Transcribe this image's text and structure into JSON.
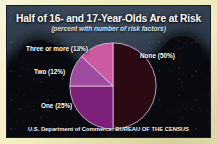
{
  "graphic": {
    "title": "Half of 16- and 17-Year-Olds Are at Risk",
    "subtitle": "(percent with number of risk factors)",
    "footer": "U.S. Department of Commerce: BUREAU OF THE CENSUS",
    "frame_color": "#f1ecbd",
    "panel_color": "#27313f"
  },
  "labels": {
    "three_or_more": "Three or more (13%)",
    "two": "Two (12%)",
    "one": "One (25%)",
    "none": "None (50%)"
  },
  "chart_data": {
    "type": "pie",
    "title": "Half of 16- and 17-Year-Olds Are at Risk",
    "subtitle": "(percent with number of risk factors)",
    "xlabel": "",
    "ylabel": "",
    "legend_position": "callout-labels",
    "grid": false,
    "units": "percent",
    "total": 100,
    "start_angle_deg": 0,
    "direction": "clockwise",
    "categories": [
      "None",
      "One",
      "Two",
      "Three or more"
    ],
    "values": [
      50,
      25,
      12,
      13
    ],
    "colors": [
      "#2b0a14",
      "#7c2079",
      "#9f4ca0",
      "#cc5aa2"
    ],
    "slices": [
      {
        "label": "None",
        "value": 50,
        "display": "None (50%)",
        "color": "#2b0a14"
      },
      {
        "label": "One",
        "value": 25,
        "display": "One (25%)",
        "color": "#7c2079"
      },
      {
        "label": "Two",
        "value": 12,
        "display": "Two (12%)",
        "color": "#9f4ca0"
      },
      {
        "label": "Three or more",
        "value": 13,
        "display": "Three or more (13%)",
        "color": "#cc5aa2"
      }
    ],
    "annotations": [
      "U.S. Department of Commerce: BUREAU OF THE CENSUS"
    ]
  }
}
